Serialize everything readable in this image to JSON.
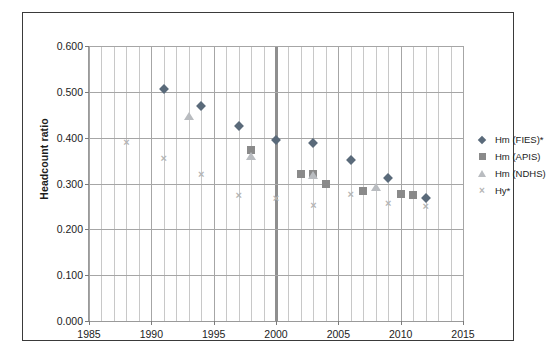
{
  "chart_data": {
    "type": "scatter",
    "title": "",
    "xlabel": "",
    "ylabel": "Headcount ratio",
    "xlim": [
      1985,
      2015
    ],
    "ylim": [
      0.0,
      0.6
    ],
    "xticks": [
      1985,
      1990,
      1995,
      2000,
      2005,
      2010,
      2015
    ],
    "yticks": [
      "0.000",
      "0.100",
      "0.200",
      "0.300",
      "0.400",
      "0.500",
      "0.600"
    ],
    "ytick_values": [
      0.0,
      0.1,
      0.2,
      0.3,
      0.4,
      0.5,
      0.6
    ],
    "grid": "vertical minor gridlines every year; horizontal gridlines at each 0.100",
    "legend_position": "right",
    "annotations": [
      {
        "name": "year-2000-vertical-marker",
        "x": 2000,
        "style": "thick vertical line"
      }
    ],
    "series": [
      {
        "name": "Hm (FIES)*",
        "marker": "diamond",
        "color": "#5a6a7a",
        "points": [
          {
            "x": 1991,
            "y": 0.506
          },
          {
            "x": 1994,
            "y": 0.47
          },
          {
            "x": 1997,
            "y": 0.425
          },
          {
            "x": 2000,
            "y": 0.395
          },
          {
            "x": 2003,
            "y": 0.388
          },
          {
            "x": 2006,
            "y": 0.352
          },
          {
            "x": 2009,
            "y": 0.313
          },
          {
            "x": 2012,
            "y": 0.268
          }
        ]
      },
      {
        "name": "Hm (APIS)",
        "marker": "square",
        "color": "#8a8a8a",
        "points": [
          {
            "x": 1998,
            "y": 0.373
          },
          {
            "x": 2002,
            "y": 0.32
          },
          {
            "x": 2003,
            "y": 0.32
          },
          {
            "x": 2004,
            "y": 0.3
          },
          {
            "x": 2007,
            "y": 0.283
          },
          {
            "x": 2010,
            "y": 0.278
          },
          {
            "x": 2011,
            "y": 0.275
          }
        ]
      },
      {
        "name": "Hm (NDHS)",
        "marker": "triangle",
        "color": "#b9bcc0",
        "points": [
          {
            "x": 1993,
            "y": 0.448
          },
          {
            "x": 1998,
            "y": 0.36
          },
          {
            "x": 2003,
            "y": 0.318
          },
          {
            "x": 2008,
            "y": 0.293
          }
        ]
      },
      {
        "name": "Hy*",
        "marker": "x",
        "color": "#b5b5b5",
        "points": [
          {
            "x": 1988,
            "y": 0.39
          },
          {
            "x": 1991,
            "y": 0.356
          },
          {
            "x": 1994,
            "y": 0.32
          },
          {
            "x": 1997,
            "y": 0.275
          },
          {
            "x": 2000,
            "y": 0.268
          },
          {
            "x": 2003,
            "y": 0.253
          },
          {
            "x": 2006,
            "y": 0.278
          },
          {
            "x": 2009,
            "y": 0.258
          },
          {
            "x": 2012,
            "y": 0.25
          }
        ]
      }
    ]
  },
  "legend": {
    "entries": [
      {
        "label": "Hm (FIES)*",
        "marker": "diamond"
      },
      {
        "label": "Hm (APIS)",
        "marker": "square"
      },
      {
        "label": "Hm (NDHS)",
        "marker": "triangle"
      },
      {
        "label": "Hy*",
        "marker": "x"
      }
    ]
  },
  "colors": {
    "fies": "#5a6a7a",
    "apis": "#8a8a8a",
    "ndhs": "#b9bcc0",
    "hy": "#b5b5b5",
    "grid_major": "#a6a6a6",
    "grid_minor": "#c8c8c8",
    "border": "#3a3a3a",
    "text": "#1c1c1c"
  }
}
